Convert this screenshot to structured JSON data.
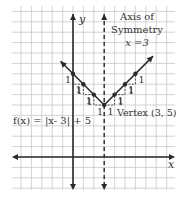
{
  "graph": {
    "function_label": "f(x) = |x- 3| + 5",
    "x_axis_label": "x",
    "y_axis_label": "y",
    "axis_of_symmetry": {
      "title_line1": "Axis of",
      "title_line2": "Symmetry",
      "equation": "x =3",
      "x": 3
    },
    "vertex": {
      "label": "Vertex (3, 5)",
      "x": 3,
      "y": 5
    },
    "x_range": [
      -5,
      10
    ],
    "y_range": [
      -3,
      15
    ],
    "points": [
      {
        "x": 0,
        "y": 8
      },
      {
        "x": 1,
        "y": 7
      },
      {
        "x": 2,
        "y": 6
      },
      {
        "x": 3,
        "y": 5
      },
      {
        "x": 4,
        "y": 6
      },
      {
        "x": 5,
        "y": 7
      },
      {
        "x": 6,
        "y": 8
      }
    ],
    "step_label": "1",
    "colors": {
      "grid": "#c8c8c8",
      "ink": "#2a2a2a"
    }
  }
}
